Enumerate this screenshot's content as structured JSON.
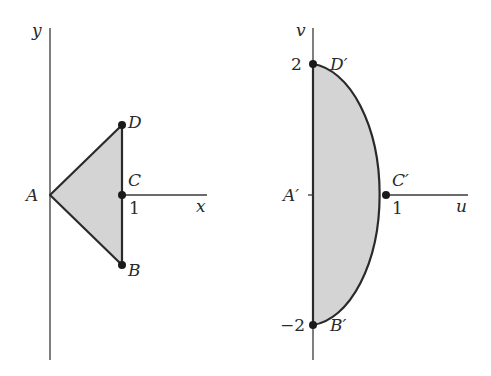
{
  "left_panel": {
    "axes": {
      "y_label": "y",
      "x_label": "x"
    },
    "tick_x": "1",
    "points": {
      "A": {
        "label": "A",
        "coords": [
          0,
          0
        ]
      },
      "B": {
        "label": "B",
        "coords": [
          1,
          -1
        ]
      },
      "C": {
        "label": "C",
        "coords": [
          1,
          0
        ]
      },
      "D": {
        "label": "D",
        "coords": [
          1,
          1
        ]
      }
    },
    "region": "triangle ABD, shaded",
    "fill_color": "#d4d4d4",
    "stroke_color": "#2a2a2a"
  },
  "right_panel": {
    "axes": {
      "v_label": "v",
      "u_label": "u"
    },
    "ticks": {
      "u_1": "1",
      "v_2": "2",
      "v_neg2": "−2"
    },
    "points": {
      "A": {
        "label": "A′",
        "coords": [
          0,
          0
        ]
      },
      "B": {
        "label": "B′",
        "coords": [
          0,
          -2
        ]
      },
      "C": {
        "label": "C′",
        "coords": [
          1,
          0
        ]
      },
      "D": {
        "label": "D′",
        "coords": [
          0,
          2
        ]
      }
    },
    "region": "half-ellipse bounded by v-axis and curve through D′, C′, B′, shaded",
    "fill_color": "#d4d4d4",
    "stroke_color": "#2a2a2a"
  }
}
